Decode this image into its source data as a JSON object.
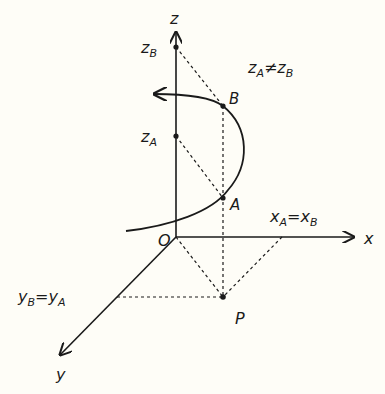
{
  "diagram": {
    "colors": {
      "background": "#fefdf7",
      "ink": "#1a1a1a"
    },
    "axes": {
      "z": {
        "label": "z"
      },
      "x": {
        "label": "x"
      },
      "y": {
        "label": "y"
      },
      "origin": {
        "label": "O"
      }
    },
    "points": {
      "A": {
        "label": "A"
      },
      "B": {
        "label": "B"
      },
      "P": {
        "label": "P"
      }
    },
    "axis_marks": {
      "zB": {
        "main": "z",
        "sub": "B"
      },
      "zA": {
        "main": "z",
        "sub": "A"
      }
    },
    "relations": {
      "z_neq": {
        "lhs_main": "z",
        "lhs_sub": "A",
        "op": "≠",
        "rhs_main": "z",
        "rhs_sub": "B"
      },
      "x_eq": {
        "lhs_main": "x",
        "lhs_sub": "A",
        "op": "=",
        "rhs_main": "x",
        "rhs_sub": "B"
      },
      "y_eq": {
        "lhs_main": "y",
        "lhs_sub": "B",
        "op": "=",
        "rhs_main": "y",
        "rhs_sub": "A"
      }
    }
  }
}
